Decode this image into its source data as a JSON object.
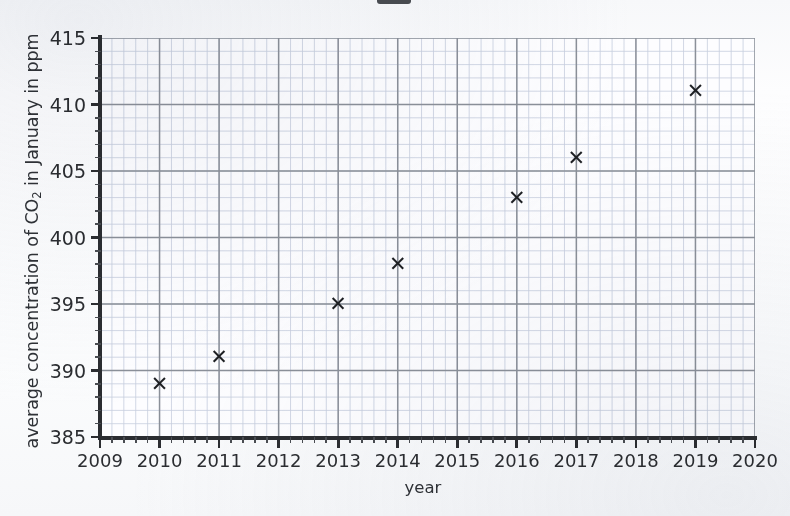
{
  "chart_data": {
    "type": "scatter",
    "title": "",
    "xlabel": "year",
    "ylabel_parts": {
      "before": "average concentration of CO",
      "sub": "2",
      "after": " in January in ppm"
    },
    "ylabel": "average concentration of CO2 in January in ppm",
    "x": [
      2010,
      2011,
      2013,
      2014,
      2016,
      2017,
      2019
    ],
    "values": [
      389,
      391,
      395,
      398,
      403,
      406,
      411
    ],
    "points": [
      {
        "year": 2010,
        "ppm": 389
      },
      {
        "year": 2011,
        "ppm": 391
      },
      {
        "year": 2013,
        "ppm": 395
      },
      {
        "year": 2014,
        "ppm": 398
      },
      {
        "year": 2016,
        "ppm": 403
      },
      {
        "year": 2017,
        "ppm": 406
      },
      {
        "year": 2019,
        "ppm": 411
      }
    ],
    "marker": "×",
    "marker_glyph": "✕",
    "xlim": [
      2009,
      2020
    ],
    "ylim": [
      385,
      415
    ],
    "xticks": [
      2009,
      2010,
      2011,
      2012,
      2013,
      2014,
      2015,
      2016,
      2017,
      2018,
      2019,
      2020
    ],
    "xtick_labels": [
      "2009",
      "2010",
      "2011",
      "2012",
      "2013",
      "2014",
      "2015",
      "2016",
      "2017",
      "2018",
      "2019",
      "2020"
    ],
    "yticks": [
      385,
      390,
      395,
      400,
      405,
      410,
      415
    ],
    "ytick_labels": [
      "385",
      "390",
      "395",
      "400",
      "405",
      "410",
      "415"
    ],
    "x_minor_per_major": 5,
    "y_minor_per_major": 5,
    "grid": true,
    "legend": null,
    "legend_position": "none",
    "colors": {
      "marker": "#1d1f23",
      "axis": "#2b2d31",
      "major_grid": "#8b9099",
      "minor_grid": "#c6cede",
      "plot_background": "#fdfdff",
      "page_background": "#fbfcfd",
      "text": "#2f3237"
    }
  },
  "axis": {
    "x_title": "year",
    "y_title_before": "average concentration of CO",
    "y_title_sub": "2",
    "y_title_after": " in January in ppm"
  }
}
